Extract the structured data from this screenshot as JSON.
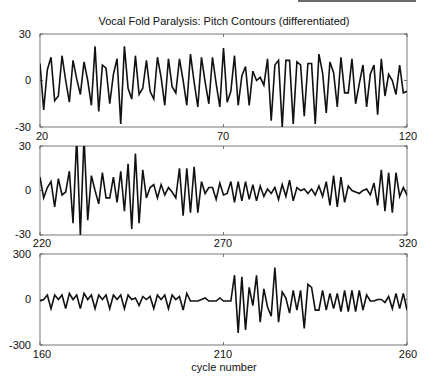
{
  "chart_data": [
    {
      "type": "line",
      "title": "Vocal Fold Paralysis: Pitch Contours (differentiated)",
      "xlabel": "",
      "ylabel": "",
      "xlim": [
        20,
        120
      ],
      "ylim": [
        -30,
        30
      ],
      "xticks": [
        "20",
        "70",
        "120"
      ],
      "yticks": [
        "30",
        "0",
        "-30"
      ],
      "x_start": 20,
      "series": [
        {
          "name": "panel-1",
          "values": [
            11,
            -19,
            7,
            15,
            -13,
            -10,
            16,
            0,
            -14,
            13,
            1,
            -9,
            12,
            0,
            -16,
            22,
            -20,
            10,
            8,
            -15,
            4,
            14,
            -28,
            22,
            -5,
            -12,
            16,
            -9,
            -5,
            13,
            -7,
            -12,
            15,
            2,
            -16,
            14,
            -4,
            -8,
            14,
            0,
            -16,
            17,
            -1,
            -17,
            15,
            -1,
            -15,
            15,
            -2,
            -17,
            21,
            -14,
            -7,
            16,
            -16,
            3,
            9,
            -16,
            6,
            0,
            2,
            -3,
            14,
            -26,
            10,
            13,
            -30,
            13,
            13,
            -28,
            12,
            10,
            -23,
            11,
            11,
            -28,
            17,
            5,
            -21,
            12,
            5,
            -17,
            15,
            -8,
            -8,
            14,
            -15,
            -2,
            10,
            -17,
            4,
            10,
            -22,
            14,
            -10,
            4,
            0,
            -9,
            10,
            -8,
            -7
          ]
        }
      ],
      "grid": false
    },
    {
      "type": "line",
      "title": "",
      "xlabel": "",
      "ylabel": "",
      "xlim": [
        220,
        320
      ],
      "ylim": [
        -30,
        30
      ],
      "xticks": [
        "220",
        "270",
        "320"
      ],
      "yticks": [
        "30",
        "0",
        "-30"
      ],
      "x_start": 220,
      "series": [
        {
          "name": "panel-2",
          "values": [
            9,
            -5,
            2,
            6,
            -11,
            8,
            -3,
            -1,
            13,
            -22,
            36,
            -30,
            36,
            -20,
            10,
            0,
            -9,
            12,
            -5,
            -5,
            9,
            -8,
            13,
            -14,
            18,
            -26,
            25,
            -22,
            14,
            -5,
            2,
            4,
            -5,
            4,
            -3,
            2,
            -1,
            -5,
            15,
            -17,
            15,
            -15,
            16,
            -15,
            6,
            -2,
            2,
            2,
            -6,
            5,
            -3,
            -2,
            6,
            -8,
            6,
            -7,
            6,
            -6,
            4,
            -7,
            3,
            -4,
            1,
            -2,
            2,
            -6,
            4,
            -4,
            7,
            -7,
            2,
            0,
            1,
            -2,
            1,
            -3,
            3,
            -4,
            6,
            -10,
            10,
            -11,
            9,
            -8,
            3,
            0,
            -1,
            -2,
            0,
            1,
            -3,
            5,
            -10,
            14,
            -14,
            12,
            -15,
            12,
            -4,
            2,
            -3,
            0
          ]
        }
      ],
      "grid": false
    },
    {
      "type": "line",
      "title": "",
      "xlabel": "cycle number",
      "ylabel": "",
      "xlim": [
        160,
        260
      ],
      "ylim": [
        -300,
        300
      ],
      "xticks": [
        "160",
        "210",
        "260"
      ],
      "yticks": [
        "300",
        "0",
        "-300"
      ],
      "x_start": 160,
      "series": [
        {
          "name": "panel-3",
          "values": [
            -10,
            0,
            30,
            -60,
            30,
            0,
            30,
            -60,
            40,
            0,
            30,
            -60,
            40,
            0,
            30,
            -60,
            30,
            0,
            30,
            -60,
            30,
            0,
            30,
            -60,
            30,
            0,
            10,
            -40,
            20,
            0,
            20,
            -60,
            30,
            0,
            30,
            -60,
            30,
            0,
            20,
            -70,
            40,
            -10,
            -10,
            -10,
            0,
            10,
            -10,
            -10,
            -10,
            10,
            -10,
            -10,
            -10,
            160,
            -220,
            150,
            -200,
            80,
            -40,
            160,
            -150,
            70,
            -50,
            -110,
            210,
            -150,
            50,
            10,
            -90,
            60,
            -70,
            60,
            -190,
            100,
            80,
            -70,
            -70,
            60,
            -70,
            40,
            -60,
            40,
            -80,
            60,
            -80,
            60,
            -80,
            60,
            -70,
            30,
            -10,
            -10,
            0,
            0,
            -20,
            20,
            -60,
            40,
            -60,
            40,
            -70,
            40
          ]
        }
      ],
      "grid": false
    }
  ]
}
